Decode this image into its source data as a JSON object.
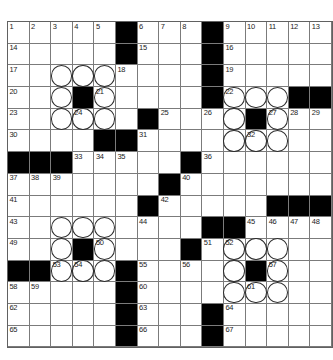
{
  "puzzle": {
    "title": "crossword-grid",
    "rows": 15,
    "cols": 15,
    "black_cells": [
      [
        1,
        6
      ],
      [
        1,
        10
      ],
      [
        2,
        6
      ],
      [
        2,
        10
      ],
      [
        3,
        10
      ],
      [
        4,
        4
      ],
      [
        4,
        10
      ],
      [
        4,
        14
      ],
      [
        4,
        15
      ],
      [
        5,
        7
      ],
      [
        5,
        12
      ],
      [
        6,
        5
      ],
      [
        6,
        6
      ],
      [
        7,
        1
      ],
      [
        7,
        2
      ],
      [
        7,
        3
      ],
      [
        7,
        9
      ],
      [
        8,
        8
      ],
      [
        9,
        7
      ],
      [
        9,
        13
      ],
      [
        9,
        14
      ],
      [
        9,
        15
      ],
      [
        10,
        10
      ],
      [
        10,
        11
      ],
      [
        11,
        4
      ],
      [
        11,
        9
      ],
      [
        12,
        1
      ],
      [
        12,
        2
      ],
      [
        12,
        6
      ],
      [
        12,
        12
      ],
      [
        13,
        6
      ],
      [
        14,
        6
      ],
      [
        14,
        10
      ],
      [
        15,
        6
      ],
      [
        15,
        10
      ]
    ],
    "circled_cells": [
      [
        3,
        3
      ],
      [
        3,
        4
      ],
      [
        3,
        5
      ],
      [
        4,
        3
      ],
      [
        4,
        5
      ],
      [
        5,
        3
      ],
      [
        5,
        4
      ],
      [
        5,
        5
      ],
      [
        4,
        11
      ],
      [
        4,
        12
      ],
      [
        4,
        13
      ],
      [
        5,
        11
      ],
      [
        5,
        13
      ],
      [
        6,
        11
      ],
      [
        6,
        12
      ],
      [
        6,
        13
      ],
      [
        10,
        3
      ],
      [
        10,
        4
      ],
      [
        10,
        5
      ],
      [
        11,
        3
      ],
      [
        11,
        5
      ],
      [
        12,
        3
      ],
      [
        12,
        4
      ],
      [
        12,
        5
      ],
      [
        11,
        11
      ],
      [
        11,
        12
      ],
      [
        11,
        13
      ],
      [
        12,
        11
      ],
      [
        12,
        13
      ],
      [
        13,
        11
      ],
      [
        13,
        12
      ],
      [
        13,
        13
      ]
    ],
    "numbers": [
      {
        "r": 1,
        "c": 1,
        "n": "1"
      },
      {
        "r": 1,
        "c": 2,
        "n": "2"
      },
      {
        "r": 1,
        "c": 3,
        "n": "3"
      },
      {
        "r": 1,
        "c": 4,
        "n": "4"
      },
      {
        "r": 1,
        "c": 5,
        "n": "5"
      },
      {
        "r": 1,
        "c": 7,
        "n": "6"
      },
      {
        "r": 1,
        "c": 8,
        "n": "7"
      },
      {
        "r": 1,
        "c": 9,
        "n": "8"
      },
      {
        "r": 1,
        "c": 11,
        "n": "9"
      },
      {
        "r": 1,
        "c": 12,
        "n": "10"
      },
      {
        "r": 1,
        "c": 13,
        "n": "11"
      },
      {
        "r": 1,
        "c": 14,
        "n": "12"
      },
      {
        "r": 1,
        "c": 15,
        "n": "13"
      },
      {
        "r": 2,
        "c": 1,
        "n": "14"
      },
      {
        "r": 2,
        "c": 7,
        "n": "15"
      },
      {
        "r": 2,
        "c": 11,
        "n": "16"
      },
      {
        "r": 3,
        "c": 1,
        "n": "17"
      },
      {
        "r": 3,
        "c": 6,
        "n": "18"
      },
      {
        "r": 3,
        "c": 11,
        "n": "19"
      },
      {
        "r": 4,
        "c": 1,
        "n": "20"
      },
      {
        "r": 4,
        "c": 5,
        "n": "21"
      },
      {
        "r": 4,
        "c": 11,
        "n": "22"
      },
      {
        "r": 5,
        "c": 1,
        "n": "23"
      },
      {
        "r": 5,
        "c": 4,
        "n": "24"
      },
      {
        "r": 5,
        "c": 8,
        "n": "25"
      },
      {
        "r": 5,
        "c": 10,
        "n": "26"
      },
      {
        "r": 5,
        "c": 13,
        "n": "27"
      },
      {
        "r": 5,
        "c": 14,
        "n": "28"
      },
      {
        "r": 5,
        "c": 15,
        "n": "29"
      },
      {
        "r": 6,
        "c": 1,
        "n": "30"
      },
      {
        "r": 6,
        "c": 7,
        "n": "31"
      },
      {
        "r": 6,
        "c": 12,
        "n": "32"
      },
      {
        "r": 7,
        "c": 4,
        "n": "33"
      },
      {
        "r": 7,
        "c": 5,
        "n": "34"
      },
      {
        "r": 7,
        "c": 6,
        "n": "35"
      },
      {
        "r": 7,
        "c": 10,
        "n": "36"
      },
      {
        "r": 8,
        "c": 1,
        "n": "37"
      },
      {
        "r": 8,
        "c": 2,
        "n": "38"
      },
      {
        "r": 8,
        "c": 3,
        "n": "39"
      },
      {
        "r": 8,
        "c": 9,
        "n": "40"
      },
      {
        "r": 9,
        "c": 1,
        "n": "41"
      },
      {
        "r": 9,
        "c": 8,
        "n": "42"
      },
      {
        "r": 10,
        "c": 1,
        "n": "43"
      },
      {
        "r": 10,
        "c": 7,
        "n": "44"
      },
      {
        "r": 10,
        "c": 12,
        "n": "45"
      },
      {
        "r": 10,
        "c": 13,
        "n": "46"
      },
      {
        "r": 10,
        "c": 14,
        "n": "47"
      },
      {
        "r": 10,
        "c": 15,
        "n": "48"
      },
      {
        "r": 11,
        "c": 1,
        "n": "49"
      },
      {
        "r": 11,
        "c": 5,
        "n": "50"
      },
      {
        "r": 11,
        "c": 10,
        "n": "51"
      },
      {
        "r": 11,
        "c": 11,
        "n": "52"
      },
      {
        "r": 12,
        "c": 3,
        "n": "53"
      },
      {
        "r": 12,
        "c": 4,
        "n": "54"
      },
      {
        "r": 12,
        "c": 7,
        "n": "55"
      },
      {
        "r": 12,
        "c": 9,
        "n": "56"
      },
      {
        "r": 12,
        "c": 13,
        "n": "57"
      },
      {
        "r": 13,
        "c": 1,
        "n": "58"
      },
      {
        "r": 13,
        "c": 2,
        "n": "59"
      },
      {
        "r": 13,
        "c": 7,
        "n": "60"
      },
      {
        "r": 13,
        "c": 12,
        "n": "61"
      },
      {
        "r": 14,
        "c": 1,
        "n": "62"
      },
      {
        "r": 14,
        "c": 7,
        "n": "63"
      },
      {
        "r": 14,
        "c": 11,
        "n": "64"
      },
      {
        "r": 15,
        "c": 1,
        "n": "65"
      },
      {
        "r": 15,
        "c": 7,
        "n": "66"
      },
      {
        "r": 15,
        "c": 11,
        "n": "67"
      }
    ]
  },
  "colors": {
    "page_bg": "#ffffff",
    "cell_bg": "#ffffff",
    "grid_line": "#7b7b7b",
    "outer_line": "#616161",
    "black_cell": "#000000",
    "number": "#1c1c1c",
    "circle_stroke": "#2e2e2e"
  }
}
